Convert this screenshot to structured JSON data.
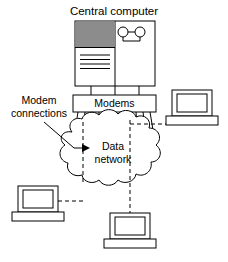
{
  "diagram": {
    "type": "network-topology-diagram",
    "background_color": "#ffffff",
    "line_color": "#000000",
    "fill_color": "#ffffff",
    "shade_color": "#8c8c8c",
    "labels": {
      "title": "Central computer",
      "modems": "Modems",
      "modem_connections_line1": "Modem",
      "modem_connections_line2": "connections",
      "cloud_line1": "Data",
      "cloud_line2": "network"
    },
    "nodes": {
      "central_computer": {
        "name": "Central computer",
        "panel_shaded": true,
        "text_lines": 4,
        "tape_reels": 2
      },
      "modems_box": {
        "name": "Modems",
        "uplinks": 3,
        "downlinks": 11
      },
      "cloud": {
        "name": "Data network",
        "lobes": 11
      },
      "terminals": [
        {
          "id": "terminal-right",
          "position": "right"
        },
        {
          "id": "terminal-left",
          "position": "bottom-left"
        },
        {
          "id": "terminal-bottom",
          "position": "bottom-center"
        }
      ]
    },
    "connections": [
      {
        "from": "central-computer",
        "to": "modems-box",
        "style": "solid",
        "count": 3
      },
      {
        "from": "modems-box",
        "to": "cloud",
        "style": "solid",
        "count": 11
      },
      {
        "from": "cloud",
        "to": "terminal-right",
        "style": "dashed"
      },
      {
        "from": "cloud",
        "to": "terminal-left",
        "style": "dashed"
      },
      {
        "from": "cloud",
        "to": "terminal-bottom",
        "style": "dashed"
      },
      {
        "from": "modem-connections-label",
        "to": "cloud",
        "style": "leader-arrow"
      }
    ]
  }
}
